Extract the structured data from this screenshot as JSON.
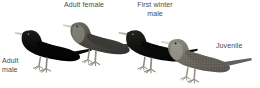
{
  "plate": {
    "title": "Starling plumages comparison plate",
    "background_color": "#ffffff",
    "label_color": "#4a4a4a",
    "width": 260,
    "height": 88
  },
  "labels": {
    "adult_female": "Adult female",
    "first_winter_male": "First winter\nmale",
    "adult_male": "Adult\nmale",
    "juvenile": "Juvenile"
  },
  "birds": [
    {
      "id": "adult-male",
      "label": "Adult male",
      "plumage": "glossy solid black",
      "body_color": "#0d0d0d",
      "bill_color": "#c9c4b4",
      "leg_color": "#8d8a80",
      "facing": "left",
      "order": 1
    },
    {
      "id": "adult-female",
      "label": "Adult female",
      "plumage": "dark grey-brown with pale throat",
      "body_color": "#4b4843",
      "bill_color": "#cfcabc",
      "leg_color": "#908d83",
      "facing": "left",
      "order": 2
    },
    {
      "id": "first-winter-male",
      "label": "First winter male",
      "plumage": "blackish with faint spotting",
      "body_color": "#141413",
      "bill_color": "#b9b4a6",
      "leg_color": "#8d8a80",
      "facing": "left",
      "order": 3
    },
    {
      "id": "juvenile",
      "label": "Juvenile",
      "plumage": "pale grey-brown, heavily speckled",
      "body_color": "#6f6c64",
      "bill_color": "#d8d4c8",
      "leg_color": "#97948a",
      "facing": "left",
      "order": 4
    }
  ]
}
